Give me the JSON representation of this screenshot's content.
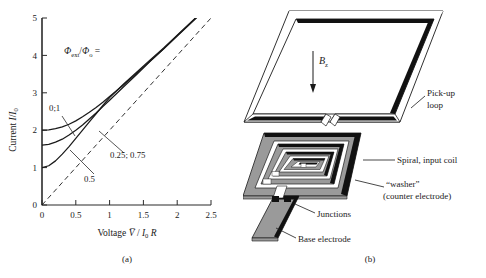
{
  "figure": {
    "panels": [
      {
        "id": "a",
        "caption": "(a)"
      },
      {
        "id": "b",
        "caption": "(b)"
      }
    ]
  },
  "chart_data": {
    "type": "line",
    "title": "",
    "xlabel": "Voltage V / I0 R",
    "ylabel": "Current I/I0",
    "xlim": [
      0,
      2.5
    ],
    "ylim": [
      0,
      5
    ],
    "xticks": [
      "0",
      "0.5",
      "1",
      "1.5",
      "2",
      "2.5"
    ],
    "xtick_values": [
      0,
      0.5,
      1,
      1.5,
      2,
      2.5
    ],
    "yticks": [
      "0",
      "1",
      "2",
      "3",
      "4",
      "5"
    ],
    "ytick_values": [
      0,
      1,
      2,
      3,
      4,
      5
    ],
    "grid": false,
    "legend_title": "Φext/Φo =",
    "series": [
      {
        "name": "0; 1",
        "label": "0;1",
        "style": "solid",
        "x": [
          0,
          0.1,
          0.2,
          0.3,
          0.4,
          0.5,
          0.6,
          0.7,
          0.8,
          0.9,
          1.0,
          1.2,
          1.4,
          1.6,
          1.8,
          2.0,
          2.2,
          2.4,
          2.5
        ],
        "y": [
          2.0,
          2.01,
          2.04,
          2.09,
          2.16,
          2.25,
          2.36,
          2.48,
          2.61,
          2.75,
          2.9,
          3.2,
          3.52,
          3.85,
          4.18,
          4.52,
          4.86,
          5.2,
          5.37
        ]
      },
      {
        "name": "0.25; 0.75",
        "label": "0.25; 0.75",
        "style": "solid",
        "x": [
          0,
          0.1,
          0.2,
          0.3,
          0.4,
          0.5,
          0.6,
          0.7,
          0.8,
          0.9,
          1.0,
          1.2,
          1.4,
          1.6,
          1.8,
          2.0,
          2.2,
          2.4,
          2.5
        ],
        "y": [
          1.6,
          1.62,
          1.68,
          1.76,
          1.87,
          2.0,
          2.14,
          2.3,
          2.46,
          2.63,
          2.8,
          3.15,
          3.49,
          3.84,
          4.18,
          4.53,
          4.87,
          5.21,
          5.38
        ]
      },
      {
        "name": "0.5",
        "label": "0.5",
        "style": "solid",
        "x": [
          0,
          0.1,
          0.2,
          0.3,
          0.4,
          0.5,
          0.6,
          0.7,
          0.8,
          0.9,
          1.0,
          1.2,
          1.4,
          1.6,
          1.8,
          2.0,
          2.2,
          2.4,
          2.5
        ],
        "y": [
          1.0,
          1.05,
          1.18,
          1.36,
          1.56,
          1.78,
          2.0,
          2.22,
          2.44,
          2.66,
          2.87,
          3.22,
          3.55,
          3.88,
          4.2,
          4.54,
          4.88,
          5.22,
          5.39
        ]
      },
      {
        "name": "ohmic asymptote",
        "label": "",
        "style": "dashed",
        "x": [
          0,
          2.5
        ],
        "y": [
          0,
          5.0
        ]
      }
    ],
    "annotations": [
      {
        "text": "Φext/Φo =",
        "x": 0.32,
        "y": 4.25
      },
      {
        "text": "0;1",
        "x": 0.12,
        "y": 2.85
      },
      {
        "text": "0.25; 0.75",
        "x": 1.02,
        "y": 1.5
      },
      {
        "text": "0.5",
        "x": 0.62,
        "y": 0.8
      }
    ]
  },
  "diagram": {
    "field_label": "Bz",
    "field_symbol": "B",
    "field_subscript": "z",
    "labels": [
      {
        "key": "pickup",
        "line1": "Pick-up",
        "line2": "loop"
      },
      {
        "key": "spiral",
        "line1": "Spiral, input coil",
        "line2": ""
      },
      {
        "key": "washer",
        "line1": "“washer”",
        "line2": "(counter electrode)"
      },
      {
        "key": "junctions",
        "line1": "Junctions",
        "line2": ""
      },
      {
        "key": "base",
        "line1": "Base electrode",
        "line2": ""
      }
    ],
    "colors": {
      "metal_gray": "#9a9a9a",
      "dark": "#111111",
      "white": "#ffffff",
      "outline": "#1a1a1a"
    }
  }
}
